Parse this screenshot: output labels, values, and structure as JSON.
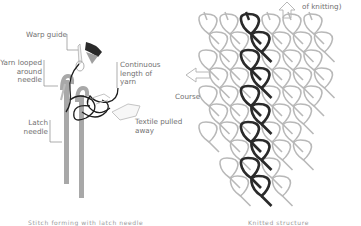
{
  "figure": {
    "left_panel": {
      "title": "Latch needle knitting mechanism",
      "labels": {
        "warp_guide": "Warp guide",
        "yarn_looped": "Yarn looped\naround\nneedle",
        "continuous_length": "Continuous\nlength of\nyarn",
        "latch_needle": "Latch\nneedle",
        "textile_pulled": "Textile pulled\naway"
      },
      "caption_partial": "Stitch forming with latch needle"
    },
    "middle": {
      "arrow_direction": "left",
      "label": "Course"
    },
    "right_panel": {
      "top_label_partial": "of knitting)",
      "arrow_direction": "up",
      "highlighted_column": "wale",
      "caption_partial": "Knitted structure"
    },
    "colors": {
      "outline_loop": "#b8b8b8",
      "highlight_loop": "#2a2a2a",
      "needle": "#a8a8a8",
      "text": "#707070"
    }
  }
}
